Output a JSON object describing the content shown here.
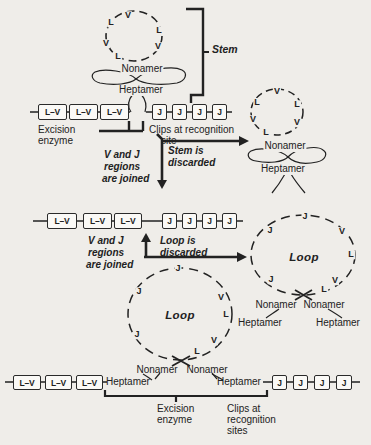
{
  "palette": {
    "bg": "#efede9",
    "ink": "#222222",
    "box_fill": "#faf9f6"
  },
  "boxes": {
    "lv": "L–V",
    "j": "J"
  },
  "shared": {
    "nonamer": "Nonamer",
    "heptamer": "Heptamer",
    "loop": "Loop"
  },
  "stage1": {
    "circle_letters": [
      "V",
      "L",
      "L",
      "V",
      "V",
      "L"
    ],
    "stem_label": "Stem",
    "excision_enzyme": [
      "Excision",
      "enzyme"
    ],
    "clips_label": [
      "Clips at recognition",
      "site"
    ]
  },
  "step1": {
    "stem_discarded": [
      "Stem is",
      "discarded"
    ],
    "vj_joined": [
      "V and J",
      "regions",
      "are joined"
    ]
  },
  "stage2": {
    "circle_letters": [
      "V",
      "L",
      "L",
      "V",
      "V",
      "L"
    ]
  },
  "step2": {
    "loop_discarded": [
      "Loop is",
      "discarded"
    ],
    "vj_joined": [
      "V and J",
      "regions",
      "are joined"
    ]
  },
  "loop_right": {
    "letters": [
      "J",
      "J",
      "V",
      "L",
      "J",
      "V",
      "L"
    ]
  },
  "loop_bottom": {
    "letters": [
      "J",
      "J",
      "V",
      "L",
      "J",
      "V",
      "L"
    ]
  },
  "stage3": {
    "excision_enzyme": [
      "Excision",
      "enzyme"
    ],
    "clips_label": [
      "Clips at",
      "recognition",
      "sites"
    ]
  }
}
